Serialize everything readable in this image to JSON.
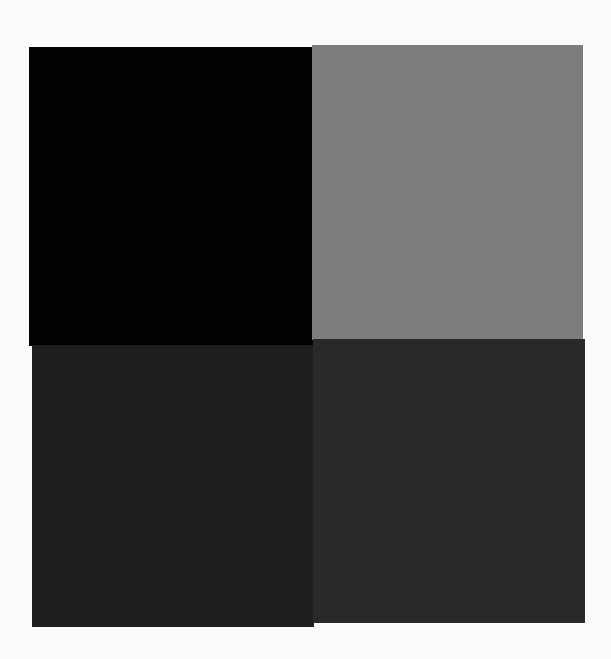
{
  "canvas": {
    "background": "#fbfbfb",
    "width": 611,
    "height": 659
  },
  "grid": {
    "rows": 2,
    "columns": 2,
    "swatches": [
      {
        "position": "top-left",
        "color": "#020202",
        "label": "black"
      },
      {
        "position": "top-right",
        "color": "#7d7d7d",
        "label": "mid-gray"
      },
      {
        "position": "bottom-left",
        "color": "#1f1f1f",
        "label": "dark-gray"
      },
      {
        "position": "bottom-right",
        "color": "#292929",
        "label": "dark-gray-lighter"
      }
    ]
  }
}
